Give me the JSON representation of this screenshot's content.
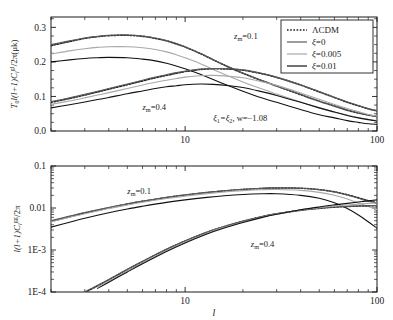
{
  "figure": {
    "background": "#ffffff",
    "axis_color": "#1b1b1b",
    "xlabel": "l",
    "panels": [
      "top",
      "bottom"
    ]
  },
  "legend": {
    "position": "top-right",
    "entries": [
      {
        "label": "ΛCDM",
        "style": "dotted",
        "color": "#1b1b1b"
      },
      {
        "label": "ξ=0",
        "style": "solid",
        "color": "#5a5a5a"
      },
      {
        "label": "ξ=0.005",
        "style": "solid",
        "color": "#a8a8a8"
      },
      {
        "label": "ξ=0.01",
        "style": "solid",
        "color": "#111111"
      }
    ]
  },
  "chart_data": [
    {
      "type": "line",
      "panel": "top",
      "title": "",
      "ylabel": "T0 sqrt(l(l+1)Cl^gl/2pi) (uk)",
      "ylabel_parts": {
        "prefix": "T",
        "sub1": "0",
        "mid": "l(l+1)C",
        "sub2": "l",
        "sup": "gl",
        "suffix": "/2π(μk)"
      },
      "xlabel": "l",
      "xscale": "log",
      "yscale": "linear",
      "xlim": [
        2,
        100
      ],
      "ylim": [
        0.0,
        0.33
      ],
      "yticks": [
        0.0,
        0.1,
        0.2,
        0.3
      ],
      "yticklabels": [
        "0.0",
        "0.1",
        "0.2",
        "0.3"
      ],
      "xticks": [
        10,
        100
      ],
      "xticklabels": [
        "10",
        "100"
      ],
      "grid": false,
      "annotations": [
        {
          "text": "z_m=0.1",
          "parts": {
            "base": "z",
            "sub": "m",
            "rest": "=0.1"
          },
          "x": 18,
          "y": 0.265
        },
        {
          "text": "z_m=0.4",
          "parts": {
            "base": "z",
            "sub": "m",
            "rest": "=0.4"
          },
          "x": 6.0,
          "y": 0.062
        },
        {
          "text": "ξ1=ξ2, w=−1.08",
          "parts": {
            "p1": "ξ",
            "s1": "1",
            "p2": "=ξ",
            "s2": "2",
            "p3": ", w=−1.08"
          },
          "x": 14,
          "y": 0.028
        }
      ],
      "series": [
        {
          "name": "ΛCDM z_m=0.1",
          "style": "dotted",
          "color": "#1b1b1b",
          "group": "zm0.1",
          "x": [
            2,
            2.5,
            3,
            3.5,
            4,
            5,
            6,
            7,
            8,
            9,
            10,
            12,
            14,
            17,
            20,
            25,
            30,
            40,
            50,
            60,
            70,
            80,
            90,
            100
          ],
          "y": [
            0.247,
            0.259,
            0.268,
            0.273,
            0.276,
            0.277,
            0.274,
            0.268,
            0.261,
            0.252,
            0.243,
            0.224,
            0.206,
            0.184,
            0.167,
            0.146,
            0.13,
            0.105,
            0.086,
            0.072,
            0.06,
            0.052,
            0.046,
            0.042
          ]
        },
        {
          "name": "ξ=0 z_m=0.1",
          "style": "solid",
          "color": "#5a5a5a",
          "group": "zm0.1",
          "x": [
            2,
            2.5,
            3,
            3.5,
            4,
            5,
            6,
            7,
            8,
            9,
            10,
            12,
            14,
            17,
            20,
            25,
            30,
            40,
            50,
            60,
            70,
            80,
            90,
            100
          ],
          "y": [
            0.25,
            0.261,
            0.269,
            0.274,
            0.277,
            0.278,
            0.275,
            0.269,
            0.262,
            0.253,
            0.244,
            0.225,
            0.207,
            0.185,
            0.168,
            0.147,
            0.131,
            0.106,
            0.087,
            0.073,
            0.061,
            0.053,
            0.047,
            0.043
          ]
        },
        {
          "name": "ξ=0.005 z_m=0.1",
          "style": "solid",
          "color": "#a8a8a8",
          "group": "zm0.1",
          "x": [
            2,
            2.5,
            3,
            3.5,
            4,
            5,
            6,
            7,
            8,
            9,
            10,
            12,
            14,
            17,
            20,
            25,
            30,
            40,
            50,
            60,
            70,
            80,
            90,
            100
          ],
          "y": [
            0.223,
            0.232,
            0.238,
            0.242,
            0.244,
            0.244,
            0.241,
            0.236,
            0.229,
            0.221,
            0.212,
            0.195,
            0.178,
            0.158,
            0.142,
            0.122,
            0.107,
            0.084,
            0.067,
            0.055,
            0.046,
            0.039,
            0.034,
            0.03
          ]
        },
        {
          "name": "ξ=0.01 z_m=0.1",
          "style": "solid",
          "color": "#111111",
          "group": "zm0.1",
          "x": [
            2,
            2.5,
            3,
            3.5,
            4,
            5,
            6,
            7,
            8,
            9,
            10,
            12,
            14,
            17,
            20,
            25,
            30,
            40,
            50,
            60,
            70,
            80,
            90,
            100
          ],
          "y": [
            0.2,
            0.206,
            0.21,
            0.212,
            0.213,
            0.212,
            0.208,
            0.203,
            0.196,
            0.188,
            0.18,
            0.164,
            0.149,
            0.13,
            0.115,
            0.096,
            0.083,
            0.062,
            0.047,
            0.038,
            0.03,
            0.025,
            0.021,
            0.019
          ]
        },
        {
          "name": "ΛCDM z_m=0.4",
          "style": "dotted",
          "color": "#1b1b1b",
          "group": "zm0.4",
          "x": [
            2,
            2.5,
            3,
            3.5,
            4,
            5,
            6,
            7,
            8,
            9,
            10,
            12,
            14,
            17,
            20,
            25,
            30,
            40,
            50,
            60,
            70,
            80,
            90,
            100
          ],
          "y": [
            0.083,
            0.094,
            0.104,
            0.113,
            0.121,
            0.134,
            0.145,
            0.154,
            0.161,
            0.167,
            0.172,
            0.178,
            0.18,
            0.179,
            0.176,
            0.166,
            0.155,
            0.133,
            0.113,
            0.097,
            0.083,
            0.073,
            0.064,
            0.058
          ]
        },
        {
          "name": "ξ=0 z_m=0.4",
          "style": "solid",
          "color": "#5a5a5a",
          "group": "zm0.4",
          "x": [
            2,
            2.5,
            3,
            3.5,
            4,
            5,
            6,
            7,
            8,
            9,
            10,
            12,
            14,
            17,
            20,
            25,
            30,
            40,
            50,
            60,
            70,
            80,
            90,
            100
          ],
          "y": [
            0.085,
            0.096,
            0.106,
            0.115,
            0.123,
            0.136,
            0.147,
            0.156,
            0.163,
            0.169,
            0.173,
            0.179,
            0.181,
            0.18,
            0.177,
            0.167,
            0.156,
            0.134,
            0.114,
            0.098,
            0.084,
            0.074,
            0.065,
            0.059
          ]
        },
        {
          "name": "ξ=0.005 z_m=0.4",
          "style": "solid",
          "color": "#a8a8a8",
          "group": "zm0.4",
          "x": [
            2,
            2.5,
            3,
            3.5,
            4,
            5,
            6,
            7,
            8,
            9,
            10,
            12,
            14,
            17,
            20,
            25,
            30,
            40,
            50,
            60,
            70,
            80,
            90,
            100
          ],
          "y": [
            0.077,
            0.087,
            0.096,
            0.104,
            0.111,
            0.123,
            0.133,
            0.141,
            0.147,
            0.152,
            0.156,
            0.16,
            0.161,
            0.158,
            0.154,
            0.143,
            0.132,
            0.11,
            0.092,
            0.077,
            0.065,
            0.056,
            0.048,
            0.043
          ]
        },
        {
          "name": "ξ=0.01 z_m=0.4",
          "style": "solid",
          "color": "#111111",
          "group": "zm0.4",
          "x": [
            2,
            2.5,
            3,
            3.5,
            4,
            5,
            6,
            7,
            8,
            9,
            10,
            12,
            14,
            17,
            20,
            25,
            30,
            40,
            50,
            60,
            70,
            80,
            90,
            100
          ],
          "y": [
            0.067,
            0.076,
            0.084,
            0.091,
            0.097,
            0.108,
            0.116,
            0.123,
            0.128,
            0.131,
            0.134,
            0.136,
            0.135,
            0.131,
            0.126,
            0.114,
            0.103,
            0.083,
            0.067,
            0.055,
            0.045,
            0.038,
            0.033,
            0.029
          ]
        }
      ]
    },
    {
      "type": "line",
      "panel": "bottom",
      "title": "",
      "ylabel": "l(l+1)Cl^gg/2pi",
      "ylabel_parts": {
        "mid": "l(l+1)C",
        "sub": "l",
        "sup": "gg",
        "suffix": "/2π"
      },
      "xlabel": "l",
      "xscale": "log",
      "yscale": "log",
      "xlim": [
        2,
        100
      ],
      "ylim": [
        0.0001,
        0.1
      ],
      "yticks": [
        0.1,
        0.01,
        0.001,
        0.0001
      ],
      "yticklabels": [
        "0.1",
        "0.01",
        "1E-3",
        "1E-4"
      ],
      "xticks": [
        10,
        100
      ],
      "xticklabels": [
        "10",
        "100"
      ],
      "grid": false,
      "annotations": [
        {
          "text": "z_m=0.1",
          "parts": {
            "base": "z",
            "sub": "m",
            "rest": "=0.1"
          },
          "x": 5.0,
          "y": 0.021
        },
        {
          "text": "z_m=0.4",
          "parts": {
            "base": "z",
            "sub": "m",
            "rest": "=0.4"
          },
          "x": 22,
          "y": 0.00115
        }
      ],
      "series": [
        {
          "name": "ΛCDM z_m=0.1",
          "style": "dotted",
          "color": "#1b1b1b",
          "group": "zm0.1",
          "x": [
            2,
            2.5,
            3,
            4,
            5,
            6,
            8,
            10,
            13,
            16,
            20,
            25,
            30,
            40,
            50,
            60,
            70,
            80,
            90,
            100
          ],
          "y": [
            0.0048,
            0.0062,
            0.0076,
            0.0101,
            0.0124,
            0.0144,
            0.0177,
            0.0203,
            0.0233,
            0.0255,
            0.0276,
            0.0292,
            0.03,
            0.0295,
            0.0274,
            0.0243,
            0.0207,
            0.0175,
            0.015,
            0.0133
          ]
        },
        {
          "name": "ξ=0 z_m=0.1",
          "style": "solid",
          "color": "#5a5a5a",
          "group": "zm0.1",
          "x": [
            2,
            2.5,
            3,
            4,
            5,
            6,
            8,
            10,
            13,
            16,
            20,
            25,
            30,
            40,
            50,
            60,
            70,
            80,
            90,
            100
          ],
          "y": [
            0.005,
            0.0064,
            0.0078,
            0.0103,
            0.0126,
            0.0146,
            0.018,
            0.0206,
            0.0236,
            0.0258,
            0.0279,
            0.0294,
            0.0302,
            0.0296,
            0.0273,
            0.024,
            0.0203,
            0.017,
            0.0145,
            0.0127
          ]
        },
        {
          "name": "ξ=0.005 z_m=0.1",
          "style": "solid",
          "color": "#a8a8a8",
          "group": "zm0.1",
          "x": [
            2,
            2.5,
            3,
            4,
            5,
            6,
            8,
            10,
            13,
            16,
            20,
            25,
            30,
            40,
            50,
            60,
            70,
            80,
            90,
            100
          ],
          "y": [
            0.0047,
            0.006,
            0.0073,
            0.0097,
            0.0118,
            0.0137,
            0.0168,
            0.0192,
            0.022,
            0.0241,
            0.0259,
            0.0272,
            0.0276,
            0.0263,
            0.0236,
            0.0201,
            0.0164,
            0.0132,
            0.0108,
            0.0092
          ]
        },
        {
          "name": "ξ=0.01 z_m=0.1",
          "style": "solid",
          "color": "#111111",
          "group": "zm0.1",
          "x": [
            2,
            2.5,
            3,
            4,
            5,
            6,
            8,
            10,
            13,
            16,
            20,
            25,
            30,
            40,
            50,
            60,
            70,
            80,
            90,
            100
          ],
          "y": [
            0.0035,
            0.0046,
            0.0057,
            0.0077,
            0.0095,
            0.011,
            0.0136,
            0.0156,
            0.0179,
            0.0196,
            0.021,
            0.0218,
            0.0218,
            0.02,
            0.017,
            0.0133,
            0.0097,
            0.0068,
            0.0047,
            0.0033
          ]
        },
        {
          "name": "ΛCDM z_m=0.4",
          "style": "dotted",
          "color": "#1b1b1b",
          "group": "zm0.4",
          "x": [
            3,
            3.5,
            4,
            5,
            6,
            8,
            10,
            13,
            16,
            20,
            25,
            30,
            40,
            50,
            60,
            70,
            80,
            90,
            100
          ],
          "y": [
            9.8e-05,
            0.00014,
            0.000195,
            0.00034,
            0.00053,
            0.00103,
            0.00163,
            0.00263,
            0.0036,
            0.0048,
            0.00616,
            0.00725,
            0.0088,
            0.0098,
            0.01045,
            0.01085,
            0.0111,
            0.01125,
            0.01135
          ]
        },
        {
          "name": "ξ=0 z_m=0.4",
          "style": "solid",
          "color": "#5a5a5a",
          "group": "zm0.4",
          "x": [
            3,
            3.5,
            4,
            5,
            6,
            8,
            10,
            13,
            16,
            20,
            25,
            30,
            40,
            50,
            60,
            70,
            80,
            90,
            100
          ],
          "y": [
            0.000101,
            0.000145,
            0.0002,
            0.00035,
            0.00054,
            0.00105,
            0.00166,
            0.00268,
            0.00366,
            0.00488,
            0.00626,
            0.00736,
            0.00892,
            0.00992,
            0.01056,
            0.01095,
            0.0112,
            0.01135,
            0.01145
          ]
        },
        {
          "name": "ξ=0.005 z_m=0.4",
          "style": "solid",
          "color": "#a8a8a8",
          "group": "zm0.4",
          "x": [
            3,
            3.5,
            4,
            5,
            6,
            8,
            10,
            13,
            16,
            20,
            25,
            30,
            40,
            50,
            60,
            70,
            80,
            90,
            100
          ],
          "y": [
            9.2e-05,
            0.000132,
            0.000182,
            0.00032,
            0.0005,
            0.00097,
            0.00155,
            0.00252,
            0.00347,
            0.00466,
            0.00605,
            0.0072,
            0.00895,
            0.0102,
            0.0111,
            0.0118,
            0.0124,
            0.0129,
            0.0133
          ]
        },
        {
          "name": "ξ=0.01 z_m=0.4",
          "style": "solid",
          "color": "#111111",
          "group": "zm0.4",
          "x": [
            3,
            3.5,
            4,
            5,
            6,
            8,
            10,
            13,
            16,
            20,
            25,
            30,
            40,
            50,
            60,
            70,
            80,
            90,
            100
          ],
          "y": [
            8.4e-05,
            0.000122,
            0.00017,
            0.0003,
            0.00047,
            0.00092,
            0.00147,
            0.0024,
            0.00333,
            0.0045,
            0.0059,
            0.0071,
            0.00905,
            0.0106,
            0.01185,
            0.0129,
            0.0139,
            0.0148,
            0.0156
          ]
        }
      ]
    }
  ]
}
